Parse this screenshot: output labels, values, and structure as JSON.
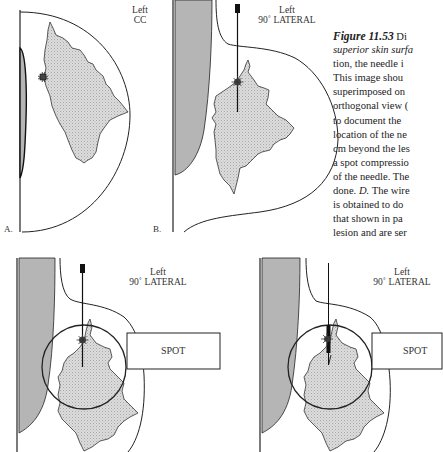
{
  "figure": {
    "number": "Figure 11.53",
    "caption_lines": [
      {
        "prefix_bold": "Figure 11.53",
        "text": " Di"
      },
      {
        "italic": "superior skin surfa",
        "text": ""
      },
      {
        "text": "tion, the needle i"
      },
      {
        "text": "This image shou"
      },
      {
        "text": "superimposed on"
      },
      {
        "text": "orthogonal view ("
      },
      {
        "text": "to document the"
      },
      {
        "text": "location of the ne"
      },
      {
        "text": "cm beyond the les"
      },
      {
        "text": "a spot compressio"
      },
      {
        "text": "of the needle. The"
      },
      {
        "text": "done. ",
        "italic_after": "D.",
        "text_after": " The wire"
      },
      {
        "text": "is obtained to do"
      },
      {
        "text": "that shown in pa"
      },
      {
        "text": "lesion and are ser"
      }
    ]
  },
  "panels": {
    "a": {
      "letter": "A.",
      "label_line1": "Left",
      "label_line2": "CC"
    },
    "b": {
      "letter": "B.",
      "label_line1": "Left",
      "label_line2": "90˚ LATERAL"
    },
    "c": {
      "label_line1": "Left",
      "label_line2": "90˚ LATERAL",
      "spot_label": "SPOT"
    },
    "d": {
      "label_line1": "Left",
      "label_line2": "90˚ LATERAL",
      "spot_label": "SPOT"
    }
  },
  "colors": {
    "line": "#222222",
    "muscle_fill": "#b5b5b5",
    "tissue_fill": "#d9d9d9"
  }
}
